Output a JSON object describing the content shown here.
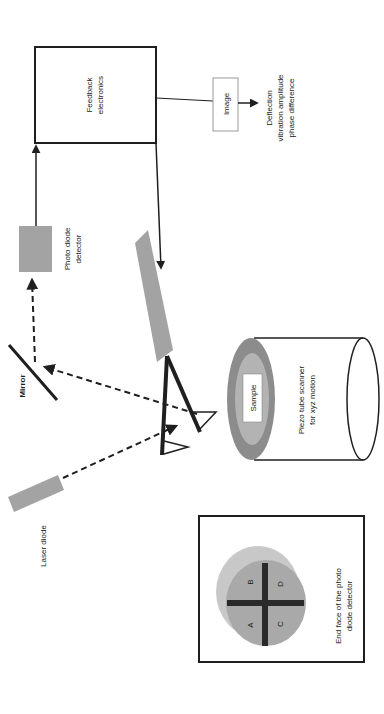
{
  "diagram": {
    "colors": {
      "line": "#1f1f1f",
      "component_gray": "#a3a3a3",
      "piezo_outer": "#8c8c8c",
      "piezo_inner": "#b3b3b3",
      "detector_light": "#c8c8c8",
      "detector_mid": "#a9a9a9",
      "background": "#ffffff"
    },
    "labels": {
      "feedback_line1": "Feedback",
      "feedback_line2": "electronics",
      "image": "Image",
      "output_line1": "Deflection",
      "output_line2": "vibration amplitude",
      "output_line3": "phase difference",
      "photodiode_line1": "Photo diode",
      "photodiode_line2": "detector",
      "mirror": "Mirror",
      "laser": "Laser diode",
      "sample": "Sample",
      "piezo_line1": "Piezo tube scanner",
      "piezo_line2": "for xyz motion",
      "detector_face_line1": "End face of the photo",
      "detector_face_line2": "diode detector",
      "quadrant_a": "A",
      "quadrant_b": "B",
      "quadrant_c": "C",
      "quadrant_d": "D"
    }
  }
}
